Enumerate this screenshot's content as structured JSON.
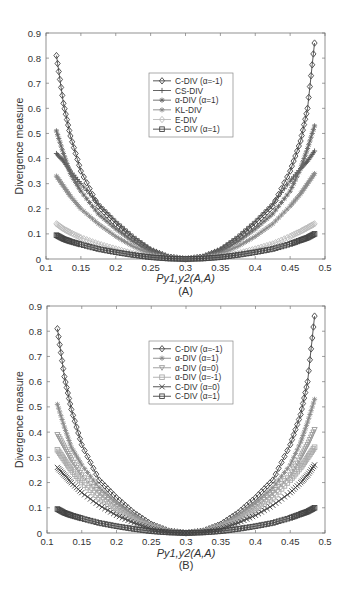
{
  "chart_data": [
    {
      "type": "line",
      "panel_label": "(A)",
      "title": "",
      "xlabel": "Py1,y2(A,A)",
      "ylabel": "Divergence measure",
      "xlim": [
        0.1,
        0.5
      ],
      "ylim": [
        0,
        0.9
      ],
      "xticks": [
        "0.1",
        "0.15",
        "0.2",
        "0.25",
        "0.3",
        "0.35",
        "0.4",
        "0.45",
        "0.5"
      ],
      "yticks": [
        "0",
        "0.1",
        "0.2",
        "0.3",
        "0.4",
        "0.5",
        "0.6",
        "0.7",
        "0.8",
        "0.9"
      ],
      "grid": false,
      "legend_position": "upper center",
      "x": [
        0.115,
        0.125,
        0.135,
        0.15,
        0.175,
        0.2,
        0.225,
        0.25,
        0.275,
        0.3,
        0.325,
        0.35,
        0.375,
        0.4,
        0.425,
        0.45,
        0.465,
        0.475,
        0.485
      ],
      "series": [
        {
          "name": "C-DIV (α=-1)",
          "marker": "diamond",
          "color": "#444444",
          "values": [
            0.81,
            0.62,
            0.49,
            0.35,
            0.21,
            0.14,
            0.08,
            0.035,
            0.008,
            0.0,
            0.008,
            0.035,
            0.08,
            0.14,
            0.21,
            0.35,
            0.47,
            0.6,
            0.86
          ]
        },
        {
          "name": "CS-DIV",
          "marker": "plus",
          "color": "#555555",
          "values": [
            0.42,
            0.39,
            0.35,
            0.3,
            0.22,
            0.15,
            0.09,
            0.04,
            0.01,
            0.0,
            0.01,
            0.04,
            0.09,
            0.15,
            0.22,
            0.31,
            0.36,
            0.39,
            0.43
          ]
        },
        {
          "name": "α-DIV (α=1)",
          "marker": "star",
          "color": "#666666",
          "values": [
            0.51,
            0.42,
            0.34,
            0.27,
            0.18,
            0.12,
            0.07,
            0.03,
            0.007,
            0.0,
            0.007,
            0.03,
            0.07,
            0.12,
            0.18,
            0.27,
            0.36,
            0.44,
            0.53
          ]
        },
        {
          "name": "KL-DIV",
          "marker": "asterisk",
          "color": "#888888",
          "values": [
            0.33,
            0.29,
            0.25,
            0.2,
            0.14,
            0.09,
            0.05,
            0.02,
            0.005,
            0.0,
            0.005,
            0.02,
            0.05,
            0.09,
            0.14,
            0.21,
            0.26,
            0.3,
            0.34
          ]
        },
        {
          "name": "E-DIV",
          "marker": "diamond-open",
          "color": "#bbbbbb",
          "values": [
            0.14,
            0.12,
            0.105,
            0.085,
            0.06,
            0.04,
            0.022,
            0.01,
            0.002,
            0.0,
            0.002,
            0.01,
            0.022,
            0.04,
            0.06,
            0.09,
            0.11,
            0.125,
            0.14
          ]
        },
        {
          "name": "C-DIV (α=1)",
          "marker": "square",
          "color": "#444444",
          "values": [
            0.095,
            0.08,
            0.07,
            0.058,
            0.04,
            0.027,
            0.016,
            0.007,
            0.002,
            0.0,
            0.002,
            0.007,
            0.016,
            0.027,
            0.04,
            0.06,
            0.075,
            0.085,
            0.1
          ]
        }
      ]
    },
    {
      "type": "line",
      "panel_label": "(B)",
      "title": "",
      "xlabel": "Py1,y2(A,A)",
      "ylabel": "Divergence measure",
      "xlim": [
        0.1,
        0.5
      ],
      "ylim": [
        0,
        0.9
      ],
      "xticks": [
        "0.1",
        "0.15",
        "0.2",
        "0.25",
        "0.3",
        "0.35",
        "0.4",
        "0.45",
        "0.5"
      ],
      "yticks": [
        "0",
        "0.1",
        "0.2",
        "0.3",
        "0.4",
        "0.5",
        "0.6",
        "0.7",
        "0.8",
        "0.9"
      ],
      "grid": false,
      "legend_position": "upper center",
      "x": [
        0.115,
        0.125,
        0.135,
        0.15,
        0.175,
        0.2,
        0.225,
        0.25,
        0.275,
        0.3,
        0.325,
        0.35,
        0.375,
        0.4,
        0.425,
        0.45,
        0.465,
        0.475,
        0.485
      ],
      "series": [
        {
          "name": "C-DIV (α=-1)",
          "marker": "diamond",
          "color": "#444444",
          "values": [
            0.81,
            0.62,
            0.49,
            0.35,
            0.21,
            0.14,
            0.08,
            0.035,
            0.008,
            0.0,
            0.008,
            0.035,
            0.08,
            0.14,
            0.21,
            0.35,
            0.47,
            0.6,
            0.86
          ]
        },
        {
          "name": "α-DIV (α=1)",
          "marker": "star",
          "color": "#888888",
          "values": [
            0.51,
            0.42,
            0.34,
            0.27,
            0.18,
            0.12,
            0.07,
            0.03,
            0.007,
            0.0,
            0.007,
            0.03,
            0.07,
            0.12,
            0.18,
            0.27,
            0.36,
            0.44,
            0.53
          ]
        },
        {
          "name": "α-DIV (α=0)",
          "marker": "triangle-down",
          "color": "#999999",
          "values": [
            0.39,
            0.34,
            0.29,
            0.23,
            0.16,
            0.105,
            0.06,
            0.026,
            0.006,
            0.0,
            0.006,
            0.026,
            0.06,
            0.105,
            0.16,
            0.23,
            0.3,
            0.35,
            0.41
          ]
        },
        {
          "name": "α-DIV (α=-1)",
          "marker": "square-open",
          "color": "#aaaaaa",
          "values": [
            0.33,
            0.29,
            0.25,
            0.2,
            0.14,
            0.09,
            0.05,
            0.022,
            0.005,
            0.0,
            0.005,
            0.022,
            0.05,
            0.09,
            0.14,
            0.21,
            0.26,
            0.3,
            0.34
          ]
        },
        {
          "name": "C-DIV (α=0)",
          "marker": "x",
          "color": "#444444",
          "values": [
            0.26,
            0.23,
            0.2,
            0.16,
            0.11,
            0.07,
            0.04,
            0.017,
            0.004,
            0.0,
            0.004,
            0.017,
            0.04,
            0.07,
            0.11,
            0.16,
            0.2,
            0.23,
            0.27
          ]
        },
        {
          "name": "C-DIV (α=1)",
          "marker": "square",
          "color": "#444444",
          "values": [
            0.095,
            0.08,
            0.07,
            0.058,
            0.04,
            0.027,
            0.016,
            0.007,
            0.002,
            0.0,
            0.002,
            0.007,
            0.016,
            0.027,
            0.04,
            0.06,
            0.075,
            0.085,
            0.1
          ]
        }
      ]
    }
  ]
}
